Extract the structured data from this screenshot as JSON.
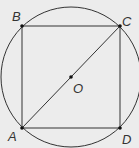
{
  "diagram": {
    "colors": {
      "background": "#ececec",
      "stroke": "#333333"
    },
    "circle": {
      "center": "O",
      "cx": 71,
      "cy": 77,
      "r": 70
    },
    "points": [
      {
        "label": "A",
        "x": 22,
        "y": 128
      },
      {
        "label": "B",
        "x": 22,
        "y": 26
      },
      {
        "label": "C",
        "x": 120,
        "y": 26
      },
      {
        "label": "D",
        "x": 120,
        "y": 128
      },
      {
        "label": "O",
        "x": 71,
        "y": 77
      }
    ],
    "segments": [
      "AB",
      "BC",
      "CD",
      "DA",
      "AC"
    ],
    "labels": {
      "A": "A",
      "B": "B",
      "C": "C",
      "D": "D",
      "O": "O"
    }
  }
}
